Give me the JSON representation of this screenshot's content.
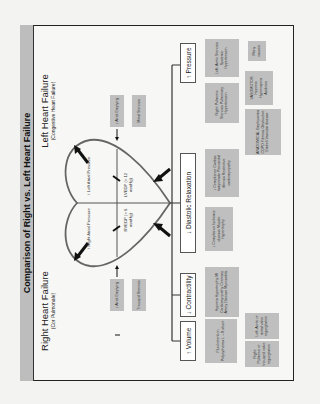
{
  "title": "Comparison of Right vs. Left Heart Failure",
  "right_hf": {
    "title": "Right Heart Failure",
    "subtitle": "(Cor Pulmonale)"
  },
  "left_hf": {
    "title": "Left Heart Failure",
    "subtitle": "(Congestive Heart Failure)"
  },
  "heart": {
    "right_atrial": "↑ Right Atrial Pressure",
    "left_atrial": "↑ Left Atrial Pressure",
    "rvedp": "RVEDP (> 6 mmHg)",
    "lvedp": "LVEDP (> 12 mmHg)"
  },
  "atrial": {
    "right_emptying": "↓ Atrial Emptying",
    "right_cause": "Tricuspid Stenosis",
    "left_emptying": "↓ Atrial Emptying",
    "left_cause": "Mitral Stenosis"
  },
  "mechanisms": {
    "volume": "↑ Volume",
    "contractility": "↓ Contractility",
    "diastolic": "↓ Diastolic Relaxation",
    "pressure": "↑ Pressure"
  },
  "causes": {
    "volume_main": "Fluid retention Polycythemia L→R shunt",
    "volume_right": "Right: Pulmonic or tricuspid valve regurgitation",
    "volume_left": "Left: Aortic or mitral valve regurgitation",
    "contractility": "Hypoxia Hypertrophy MI Cardiomyopathy Coronary Artery Disease Myocarditis",
    "diastolic_1": "↓ Compliance Ischemic disease Muscle Hypertrophy",
    "diastolic_2": "↓ Compliance Cardiac tamponade Pericardial fibrosis Restrictive cardiomyopathy",
    "pressure_right": "Right: Pulmonic Stenosis Pulmonary Hypertension",
    "pressure_left": "Left: Aortic Stenosis Systemic Hypertension",
    "vasomotor": "VASOMOTOR Hypoxia Hypercapnia Acidosis",
    "anatomical": "ANATOMICAL Emphysema COPD Fibrosis Obstructive Emboli Vascular disease",
    "many": "Many causes"
  }
}
